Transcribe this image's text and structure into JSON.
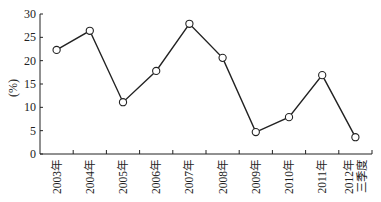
{
  "chart_data": {
    "type": "line",
    "title": "",
    "xlabel": "",
    "ylabel": "(%)",
    "ylim": [
      0,
      30
    ],
    "yticks": [
      0,
      5,
      10,
      15,
      20,
      25,
      30
    ],
    "grid": false,
    "legend": null,
    "categories": [
      "2003年",
      "2004年",
      "2005年",
      "2006年",
      "2007年",
      "2008年",
      "2009年",
      "2010年",
      "2011年",
      "2012年三季度"
    ],
    "category_lines": [
      [
        "2003年"
      ],
      [
        "2004年"
      ],
      [
        "2005年"
      ],
      [
        "2006年"
      ],
      [
        "2007年"
      ],
      [
        "2008年"
      ],
      [
        "2009年"
      ],
      [
        "2010年"
      ],
      [
        "2011年"
      ],
      [
        "2012年",
        "三季度"
      ]
    ],
    "series": [
      {
        "name": "",
        "values": [
          22.3,
          26.4,
          11.1,
          17.8,
          27.9,
          20.6,
          4.7,
          7.9,
          16.9,
          3.6
        ],
        "marker": "open-circle",
        "color": "#222222"
      }
    ]
  }
}
